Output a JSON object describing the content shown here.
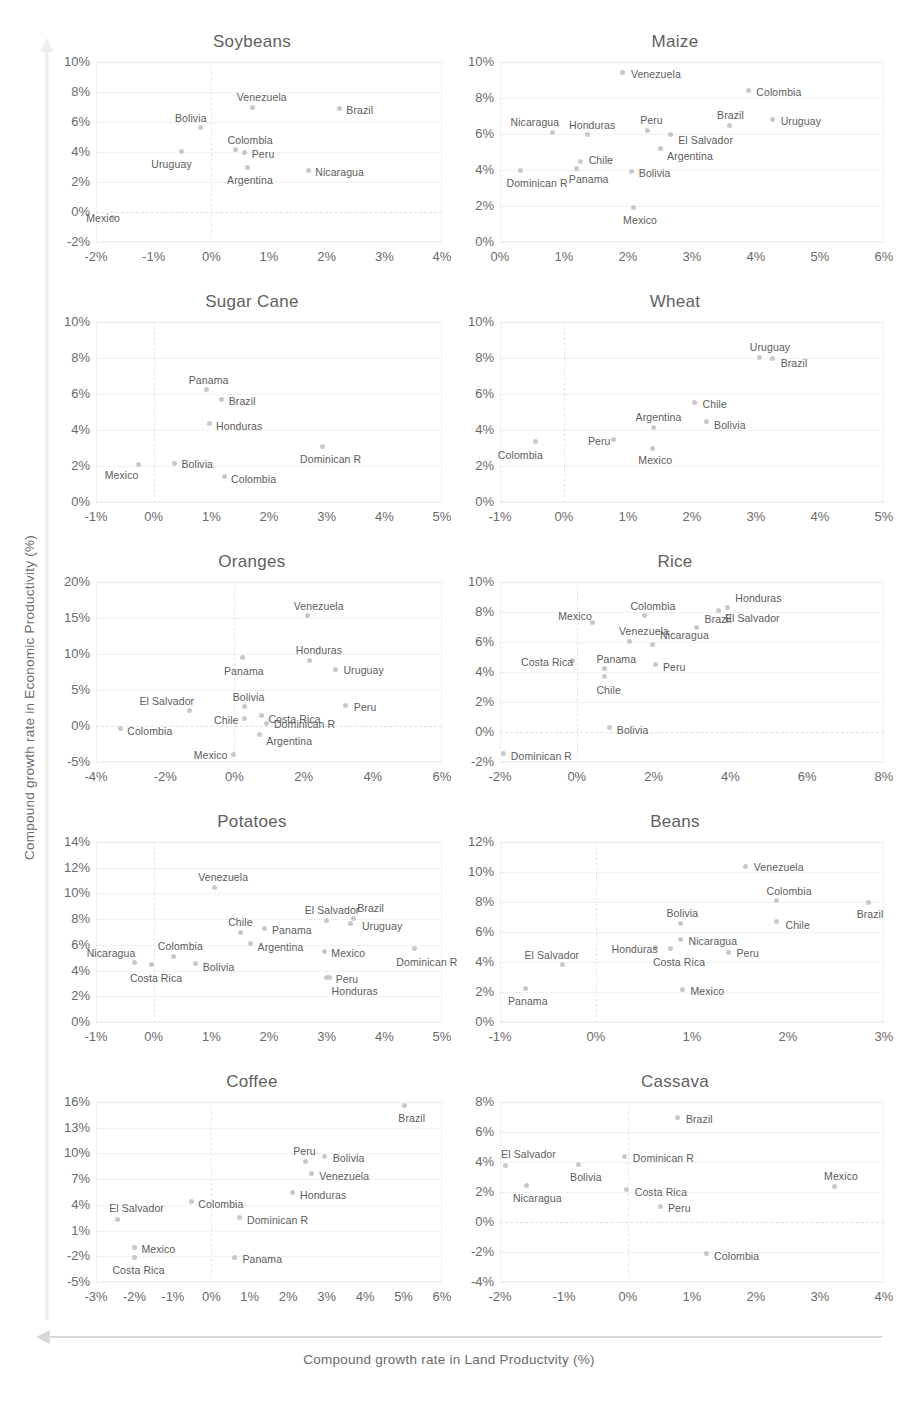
{
  "axes": {
    "y_caption": "Compound growth rate in Economic Productivity (%)",
    "x_caption": "Compound growth rate in Land Productvity (%)"
  },
  "style": {
    "dot_color": "#c9c9c9",
    "text_color": "#5c5c5c",
    "grid_color": "#e4e4e4"
  },
  "chart_data": [
    {
      "type": "scatter",
      "title": "Soybeans",
      "xlabel": "",
      "ylabel": "",
      "xlim": [
        -2,
        4
      ],
      "ylim": [
        -2,
        10
      ],
      "xticks": [
        "-2%",
        "-1%",
        "0%",
        "1%",
        "2%",
        "3%",
        "4%"
      ],
      "yticks": [
        "10%",
        "8%",
        "6%",
        "4%",
        "2%",
        "0%",
        "-2%"
      ],
      "grid": true,
      "points": [
        {
          "label": "Mexico",
          "x": -1.72,
          "y": -0.35,
          "lx": -26,
          "ly": -4
        },
        {
          "label": "Uruguay",
          "x": -0.52,
          "y": 4.05,
          "lx": -30,
          "ly": 8
        },
        {
          "label": "Bolivia",
          "x": -0.18,
          "y": 5.65,
          "lx": -26,
          "ly": -14
        },
        {
          "label": "Colombia",
          "x": 0.42,
          "y": 4.15,
          "lx": -8,
          "ly": -15
        },
        {
          "label": "Peru",
          "x": 0.58,
          "y": 4.0,
          "lx": 7,
          "ly": -3
        },
        {
          "label": "Argentina",
          "x": 0.62,
          "y": 2.95,
          "lx": -20,
          "ly": 7
        },
        {
          "label": "Venezuela",
          "x": 0.72,
          "y": 7.0,
          "lx": -16,
          "ly": -15
        },
        {
          "label": "Nicaragua",
          "x": 1.68,
          "y": 2.75,
          "lx": 7,
          "ly": -4
        },
        {
          "label": "Brazil",
          "x": 2.22,
          "y": 6.9,
          "lx": 7,
          "ly": -4
        }
      ]
    },
    {
      "type": "scatter",
      "title": "Maize",
      "xlabel": "",
      "ylabel": "",
      "xlim": [
        0,
        6
      ],
      "ylim": [
        0,
        10
      ],
      "xticks": [
        "0%",
        "1%",
        "2%",
        "3%",
        "4%",
        "5%",
        "6%"
      ],
      "yticks": [
        "10%",
        "8%",
        "6%",
        "4%",
        "2%",
        "0%"
      ],
      "grid": true,
      "points": [
        {
          "label": "Dominican R",
          "x": 0.32,
          "y": 3.95,
          "lx": -14,
          "ly": 7
        },
        {
          "label": "Nicaragua",
          "x": 0.82,
          "y": 6.1,
          "lx": -42,
          "ly": -15
        },
        {
          "label": "Panama",
          "x": 1.2,
          "y": 4.1,
          "lx": -8,
          "ly": 6
        },
        {
          "label": "Chile",
          "x": 1.26,
          "y": 4.45,
          "lx": 8,
          "ly": -7
        },
        {
          "label": "Honduras",
          "x": 1.36,
          "y": 6.0,
          "lx": -18,
          "ly": -14
        },
        {
          "label": "Bolivia",
          "x": 2.06,
          "y": 3.9,
          "lx": 7,
          "ly": -4
        },
        {
          "label": "Mexico",
          "x": 2.08,
          "y": 1.9,
          "lx": -10,
          "ly": 7
        },
        {
          "label": "Peru",
          "x": 2.3,
          "y": 6.2,
          "lx": -7,
          "ly": -15
        },
        {
          "label": "Venezuela",
          "x": 1.92,
          "y": 9.4,
          "lx": 8,
          "ly": -4
        },
        {
          "label": "Argentina",
          "x": 2.5,
          "y": 5.2,
          "lx": 7,
          "ly": 3
        },
        {
          "label": "El Salvador",
          "x": 2.66,
          "y": 6.0,
          "lx": 8,
          "ly": 1
        },
        {
          "label": "Brazil",
          "x": 3.58,
          "y": 6.5,
          "lx": -12,
          "ly": -15
        },
        {
          "label": "Colombia",
          "x": 3.88,
          "y": 8.4,
          "lx": 8,
          "ly": -4
        },
        {
          "label": "Uruguay",
          "x": 4.26,
          "y": 6.8,
          "lx": 8,
          "ly": -4
        }
      ]
    },
    {
      "type": "scatter",
      "title": "Sugar Cane",
      "xlabel": "",
      "ylabel": "",
      "xlim": [
        -1,
        5
      ],
      "ylim": [
        0,
        10
      ],
      "xticks": [
        "-1%",
        "0%",
        "1%",
        "2%",
        "3%",
        "4%",
        "5%"
      ],
      "yticks": [
        "10%",
        "8%",
        "6%",
        "4%",
        "2%",
        "0%"
      ],
      "grid": true,
      "points": [
        {
          "label": "Mexico",
          "x": -0.26,
          "y": 2.1,
          "lx": -34,
          "ly": 6
        },
        {
          "label": "Bolivia",
          "x": 0.36,
          "y": 2.15,
          "lx": 7,
          "ly": -4
        },
        {
          "label": "Panama",
          "x": 0.92,
          "y": 6.25,
          "lx": -18,
          "ly": -15
        },
        {
          "label": "Brazil",
          "x": 1.18,
          "y": 5.7,
          "lx": 7,
          "ly": -3
        },
        {
          "label": "Honduras",
          "x": 0.96,
          "y": 4.35,
          "lx": 7,
          "ly": -3
        },
        {
          "label": "Colombia",
          "x": 1.22,
          "y": 1.4,
          "lx": 7,
          "ly": -3
        },
        {
          "label": "Dominican R",
          "x": 2.92,
          "y": 3.1,
          "lx": -22,
          "ly": 8
        }
      ]
    },
    {
      "type": "scatter",
      "title": "Wheat",
      "xlabel": "",
      "ylabel": "",
      "xlim": [
        -1,
        5
      ],
      "ylim": [
        0,
        10
      ],
      "xticks": [
        "-1%",
        "0%",
        "1%",
        "2%",
        "3%",
        "4%",
        "5%"
      ],
      "yticks": [
        "10%",
        "8%",
        "6%",
        "4%",
        "2%",
        "0%"
      ],
      "grid": true,
      "points": [
        {
          "label": "Colombia",
          "x": -0.44,
          "y": 3.35,
          "lx": -38,
          "ly": 8
        },
        {
          "label": "Peru",
          "x": 0.78,
          "y": 3.45,
          "lx": -26,
          "ly": -4
        },
        {
          "label": "Argentina",
          "x": 1.4,
          "y": 4.15,
          "lx": -18,
          "ly": -15
        },
        {
          "label": "Mexico",
          "x": 1.38,
          "y": 3.0,
          "lx": -14,
          "ly": 7
        },
        {
          "label": "Chile",
          "x": 2.04,
          "y": 5.55,
          "lx": 8,
          "ly": -3
        },
        {
          "label": "Bolivia",
          "x": 2.22,
          "y": 4.45,
          "lx": 8,
          "ly": -2
        },
        {
          "label": "Uruguay",
          "x": 3.06,
          "y": 8.05,
          "lx": -10,
          "ly": -15
        },
        {
          "label": "Brazil",
          "x": 3.26,
          "y": 7.95,
          "lx": 8,
          "ly": -1
        }
      ]
    },
    {
      "type": "scatter",
      "title": "Oranges",
      "xlabel": "",
      "ylabel": "",
      "xlim": [
        -4,
        6
      ],
      "ylim": [
        -5,
        20
      ],
      "xticks": [
        "-4%",
        "-2%",
        "0%",
        "2%",
        "4%",
        "6%"
      ],
      "yticks": [
        "20%",
        "15%",
        "10%",
        "5%",
        "0%",
        "-5%"
      ],
      "grid": true,
      "points": [
        {
          "label": "Colombia",
          "x": -3.3,
          "y": -0.4,
          "lx": 7,
          "ly": -3
        },
        {
          "label": "El Salvador",
          "x": -1.3,
          "y": 2.2,
          "lx": -50,
          "ly": -14
        },
        {
          "label": "Mexico",
          "x": -0.02,
          "y": -3.9,
          "lx": -40,
          "ly": -4
        },
        {
          "label": "Panama",
          "x": 0.22,
          "y": 9.5,
          "lx": -18,
          "ly": 8
        },
        {
          "label": "Bolivia",
          "x": 0.3,
          "y": 2.7,
          "lx": -12,
          "ly": -15
        },
        {
          "label": "Chile",
          "x": 0.28,
          "y": 1.0,
          "lx": -30,
          "ly": -4
        },
        {
          "label": "Costa Rica",
          "x": 0.78,
          "y": 1.4,
          "lx": 7,
          "ly": -2
        },
        {
          "label": "Dominican R",
          "x": 0.94,
          "y": 0.4,
          "lx": 7,
          "ly": 0
        },
        {
          "label": "Argentina",
          "x": 0.72,
          "y": -1.2,
          "lx": 7,
          "ly": 1
        },
        {
          "label": "Honduras",
          "x": 2.18,
          "y": 9.1,
          "lx": -14,
          "ly": -15
        },
        {
          "label": "Venezuela",
          "x": 2.12,
          "y": 15.3,
          "lx": -14,
          "ly": -15
        },
        {
          "label": "Uruguay",
          "x": 2.92,
          "y": 7.9,
          "lx": 8,
          "ly": -4
        },
        {
          "label": "Peru",
          "x": 3.22,
          "y": 2.8,
          "lx": 8,
          "ly": -4
        }
      ]
    },
    {
      "type": "scatter",
      "title": "Rice",
      "xlabel": "",
      "ylabel": "",
      "xlim": [
        -2,
        8
      ],
      "ylim": [
        -2,
        10
      ],
      "xticks": [
        "-2%",
        "0%",
        "2%",
        "4%",
        "6%",
        "8%"
      ],
      "yticks": [
        "10%",
        "8%",
        "6%",
        "4%",
        "2%",
        "0%",
        "-2%"
      ],
      "grid": true,
      "points": [
        {
          "label": "Dominican R",
          "x": -1.9,
          "y": -1.45,
          "lx": 7,
          "ly": -3
        },
        {
          "label": "Costa Rica",
          "x": -0.1,
          "y": 4.75,
          "lx": -52,
          "ly": -4
        },
        {
          "label": "Mexico",
          "x": 0.4,
          "y": 7.3,
          "lx": -34,
          "ly": -12
        },
        {
          "label": "Panama",
          "x": 0.72,
          "y": 4.25,
          "lx": -8,
          "ly": -14
        },
        {
          "label": "Chile",
          "x": 0.72,
          "y": 3.7,
          "lx": -8,
          "ly": 8
        },
        {
          "label": "Bolivia",
          "x": 0.86,
          "y": 0.3,
          "lx": 7,
          "ly": -3
        },
        {
          "label": "Venezuela",
          "x": 1.36,
          "y": 6.05,
          "lx": -10,
          "ly": -15
        },
        {
          "label": "Colombia",
          "x": 1.76,
          "y": 7.75,
          "lx": -14,
          "ly": -15
        },
        {
          "label": "Peru",
          "x": 2.06,
          "y": 4.5,
          "lx": 7,
          "ly": -3
        },
        {
          "label": "Nicaragua",
          "x": 1.96,
          "y": 5.85,
          "lx": 8,
          "ly": -14
        },
        {
          "label": "Brazil",
          "x": 3.12,
          "y": 6.95,
          "lx": 8,
          "ly": -14
        },
        {
          "label": "El Salvador",
          "x": 3.7,
          "y": 8.1,
          "lx": 6,
          "ly": 2
        },
        {
          "label": "Honduras",
          "x": 3.92,
          "y": 8.3,
          "lx": 8,
          "ly": -15
        }
      ]
    },
    {
      "type": "scatter",
      "title": "Potatoes",
      "xlabel": "",
      "ylabel": "",
      "xlim": [
        -1,
        5
      ],
      "ylim": [
        0,
        14
      ],
      "xticks": [
        "-1%",
        "0%",
        "1%",
        "2%",
        "3%",
        "4%",
        "5%"
      ],
      "yticks": [
        "14%",
        "12%",
        "10%",
        "8%",
        "6%",
        "4%",
        "2%",
        "0%"
      ],
      "grid": true,
      "points": [
        {
          "label": "Nicaragua",
          "x": -0.33,
          "y": 4.65,
          "lx": -48,
          "ly": -14
        },
        {
          "label": "Costa Rica",
          "x": -0.03,
          "y": 4.45,
          "lx": -22,
          "ly": 8
        },
        {
          "label": "Colombia",
          "x": 0.35,
          "y": 5.1,
          "lx": -16,
          "ly": -15
        },
        {
          "label": "Bolivia",
          "x": 0.73,
          "y": 4.55,
          "lx": 7,
          "ly": -2
        },
        {
          "label": "Venezuela",
          "x": 1.05,
          "y": 10.5,
          "lx": -16,
          "ly": -15
        },
        {
          "label": "Chile",
          "x": 1.5,
          "y": 7.0,
          "lx": -12,
          "ly": -15
        },
        {
          "label": "Argentina",
          "x": 1.68,
          "y": 6.1,
          "lx": 7,
          "ly": -2
        },
        {
          "label": "Panama",
          "x": 1.93,
          "y": 7.3,
          "lx": 7,
          "ly": -3
        },
        {
          "label": "El Salvador",
          "x": 3.0,
          "y": 7.9,
          "lx": -22,
          "ly": -15
        },
        {
          "label": "Mexico",
          "x": 2.96,
          "y": 5.5,
          "lx": 7,
          "ly": -3
        },
        {
          "label": "Brazil",
          "x": 3.46,
          "y": 8.05,
          "lx": 4,
          "ly": -16
        },
        {
          "label": "Uruguay",
          "x": 3.42,
          "y": 7.7,
          "lx": 11,
          "ly": -2
        },
        {
          "label": "Peru",
          "x": 3.0,
          "y": 3.5,
          "lx": 9,
          "ly": -3
        },
        {
          "label": "Honduras",
          "x": 3.05,
          "y": 3.45,
          "lx": 2,
          "ly": 8
        },
        {
          "label": "Dominican R",
          "x": 4.52,
          "y": 5.7,
          "lx": -18,
          "ly": 8
        }
      ]
    },
    {
      "type": "scatter",
      "title": "Beans",
      "xlabel": "",
      "ylabel": "",
      "xlim": [
        -1,
        3
      ],
      "ylim": [
        0,
        12
      ],
      "xticks": [
        "-1%",
        "0%",
        "1%",
        "2%",
        "3%"
      ],
      "yticks": [
        "12%",
        "10%",
        "8%",
        "6%",
        "4%",
        "2%",
        "0%"
      ],
      "grid": true,
      "points": [
        {
          "label": "Panama",
          "x": -0.73,
          "y": 2.25,
          "lx": -18,
          "ly": 8
        },
        {
          "label": "El Salvador",
          "x": -0.35,
          "y": 3.85,
          "lx": -38,
          "ly": -14
        },
        {
          "label": "Honduras",
          "x": 0.62,
          "y": 4.95,
          "lx": -44,
          "ly": -4
        },
        {
          "label": "Costa Rica",
          "x": 0.78,
          "y": 4.9,
          "lx": -18,
          "ly": 8
        },
        {
          "label": "Nicaragua",
          "x": 0.88,
          "y": 5.5,
          "lx": 8,
          "ly": -4
        },
        {
          "label": "Bolivia",
          "x": 0.88,
          "y": 6.6,
          "lx": -14,
          "ly": -15
        },
        {
          "label": "Mexico",
          "x": 0.9,
          "y": 2.2,
          "lx": 8,
          "ly": -3
        },
        {
          "label": "Peru",
          "x": 1.38,
          "y": 4.65,
          "lx": 8,
          "ly": 0
        },
        {
          "label": "Venezuela",
          "x": 1.56,
          "y": 10.4,
          "lx": 8,
          "ly": -4
        },
        {
          "label": "Colombia",
          "x": 1.88,
          "y": 8.1,
          "lx": -10,
          "ly": -15
        },
        {
          "label": "Chile",
          "x": 1.88,
          "y": 6.7,
          "lx": 9,
          "ly": -2
        },
        {
          "label": "Brazil",
          "x": 2.84,
          "y": 8.0,
          "lx": -12,
          "ly": 7
        }
      ]
    },
    {
      "type": "scatter",
      "title": "Coffee",
      "xlabel": "",
      "ylabel": "",
      "xlim": [
        -3,
        6
      ],
      "ylim": [
        -5,
        16
      ],
      "xticks": [
        "-3%",
        "-2%",
        "-1%",
        "0%",
        "1%",
        "2%",
        "3%",
        "4%",
        "5%",
        "6%"
      ],
      "yticks": [
        "16%",
        "13%",
        "10%",
        "7%",
        "4%",
        "1%",
        "-2%",
        "-5%"
      ],
      "grid": true,
      "points": [
        {
          "label": "El Salvador",
          "x": -2.45,
          "y": 2.3,
          "lx": -8,
          "ly": -16
        },
        {
          "label": "Costa Rica",
          "x": -2.0,
          "y": -2.1,
          "lx": -22,
          "ly": 8
        },
        {
          "label": "Mexico",
          "x": -2.0,
          "y": -1.0,
          "lx": 7,
          "ly": -4
        },
        {
          "label": "Colombia",
          "x": -0.52,
          "y": 4.35,
          "lx": 7,
          "ly": -3
        },
        {
          "label": "Panama",
          "x": 0.6,
          "y": -2.1,
          "lx": 8,
          "ly": -3
        },
        {
          "label": "Dominican R",
          "x": 0.72,
          "y": 2.5,
          "lx": 8,
          "ly": -3
        },
        {
          "label": "Honduras",
          "x": 2.1,
          "y": 5.5,
          "lx": 8,
          "ly": -2
        },
        {
          "label": "Peru",
          "x": 2.44,
          "y": 9.1,
          "lx": -12,
          "ly": -15
        },
        {
          "label": "Venezuela",
          "x": 2.6,
          "y": 7.7,
          "lx": 8,
          "ly": -2
        },
        {
          "label": "Bolivia",
          "x": 2.95,
          "y": 9.6,
          "lx": 8,
          "ly": -4
        },
        {
          "label": "Brazil",
          "x": 5.02,
          "y": 15.6,
          "lx": -6,
          "ly": 8
        }
      ]
    },
    {
      "type": "scatter",
      "title": "Cassava",
      "xlabel": "",
      "ylabel": "",
      "xlim": [
        -2,
        4
      ],
      "ylim": [
        -4,
        8
      ],
      "xticks": [
        "-2%",
        "-1%",
        "0%",
        "1%",
        "2%",
        "3%",
        "4%"
      ],
      "yticks": [
        "8%",
        "6%",
        "4%",
        "2%",
        "0%",
        "-2%",
        "-4%"
      ],
      "grid": true,
      "points": [
        {
          "label": "El Salvador",
          "x": -1.92,
          "y": 3.8,
          "lx": -4,
          "ly": -16
        },
        {
          "label": "Nicaragua",
          "x": -1.58,
          "y": 2.45,
          "lx": -14,
          "ly": 8
        },
        {
          "label": "Bolivia",
          "x": -0.78,
          "y": 3.85,
          "lx": -8,
          "ly": 8
        },
        {
          "label": "Dominican R",
          "x": -0.05,
          "y": 4.35,
          "lx": 8,
          "ly": -4
        },
        {
          "label": "Costa Rica",
          "x": -0.02,
          "y": 2.15,
          "lx": 8,
          "ly": -3
        },
        {
          "label": "Peru",
          "x": 0.5,
          "y": 1.05,
          "lx": 8,
          "ly": -3
        },
        {
          "label": "Brazil",
          "x": 0.78,
          "y": 6.95,
          "lx": 8,
          "ly": -4
        },
        {
          "label": "Colombia",
          "x": 1.22,
          "y": -2.1,
          "lx": 8,
          "ly": -3
        },
        {
          "label": "Mexico",
          "x": 3.22,
          "y": 2.4,
          "lx": -10,
          "ly": -15
        }
      ]
    }
  ]
}
